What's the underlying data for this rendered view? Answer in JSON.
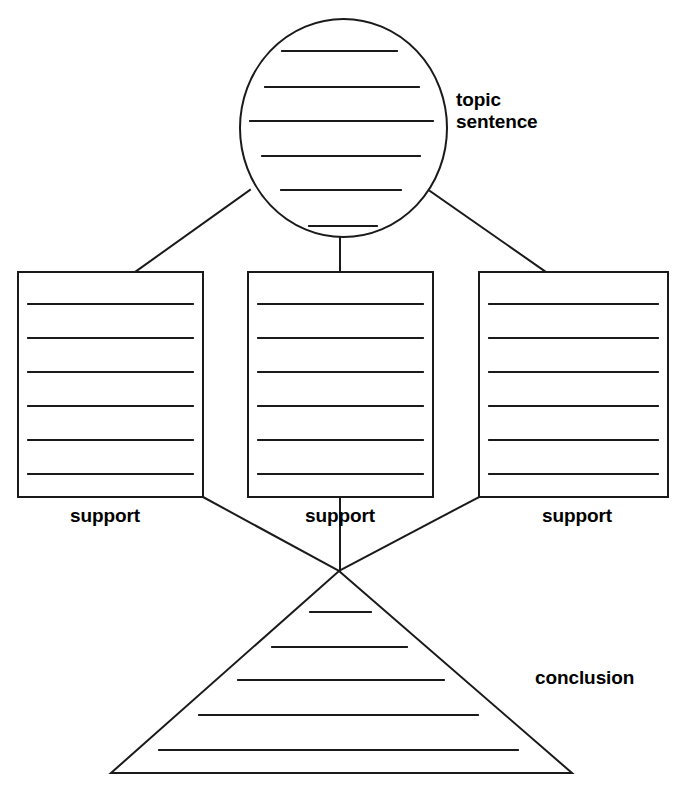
{
  "document": {
    "title": "Paragraph Writing Graphic Organizer",
    "type": "diagram",
    "background_color": "#ffffff",
    "stroke_color": "#1a1a1a",
    "text_color": "#000000"
  },
  "labels": {
    "topic_sentence": "topic\nsentence",
    "topic_sentence_line1": "topic",
    "topic_sentence_line2": "sentence",
    "support_left": "support",
    "support_middle": "support",
    "support_right": "support",
    "conclusion": "conclusion"
  },
  "shapes": {
    "topic_circle": {
      "name": "topic-sentence-circle",
      "cx": 343.5,
      "cy": 128,
      "rx": 103.5,
      "ry": 109,
      "writing_lines": 6
    },
    "support_box_left": {
      "name": "support-box-left",
      "x": 18,
      "y": 272,
      "width": 185,
      "height": 225,
      "writing_lines": 6
    },
    "support_box_middle": {
      "name": "support-box-middle",
      "x": 248,
      "y": 272,
      "width": 185,
      "height": 225,
      "writing_lines": 6
    },
    "support_box_right": {
      "name": "support-box-right",
      "x": 479,
      "y": 272,
      "width": 189,
      "height": 225,
      "writing_lines": 6
    },
    "conclusion_triangle": {
      "name": "conclusion-triangle",
      "apex_x": 339,
      "apex_y": 571,
      "base_left_x": 111,
      "base_right_x": 572,
      "base_y": 773,
      "writing_lines": 5
    }
  },
  "connectors": [
    {
      "name": "circle-to-left-box",
      "from": [
        250,
        190
      ],
      "to": [
        135,
        272
      ]
    },
    {
      "name": "circle-to-middle-box",
      "from": [
        340,
        236
      ],
      "to": [
        340,
        272
      ]
    },
    {
      "name": "circle-to-right-box",
      "from": [
        430,
        191
      ],
      "to": [
        546,
        272
      ]
    },
    {
      "name": "left-box-to-triangle",
      "from": [
        203,
        497
      ],
      "to": [
        339,
        571
      ]
    },
    {
      "name": "middle-box-to-triangle",
      "from": [
        340,
        497
      ],
      "to": [
        340,
        571
      ]
    },
    {
      "name": "right-box-to-triangle",
      "from": [
        479,
        497
      ],
      "to": [
        339,
        571
      ]
    }
  ],
  "circle_lines": [
    {
      "x1": 282,
      "x2": 397,
      "y": 51
    },
    {
      "x1": 265,
      "x2": 419,
      "y": 87
    },
    {
      "x1": 250,
      "x2": 433,
      "y": 121
    },
    {
      "x1": 262,
      "x2": 420,
      "y": 156
    },
    {
      "x1": 281,
      "x2": 401,
      "y": 190
    },
    {
      "x1": 309,
      "x2": 377,
      "y": 226
    }
  ],
  "box_line_offsets": [
    32,
    66,
    100,
    134,
    168,
    202
  ],
  "triangle_lines": [
    {
      "x1": 310,
      "x2": 371,
      "y": 612
    },
    {
      "x1": 272,
      "x2": 407,
      "y": 647
    },
    {
      "x1": 238,
      "x2": 444,
      "y": 680
    },
    {
      "x1": 199,
      "x2": 478,
      "y": 715
    },
    {
      "x1": 159,
      "x2": 518,
      "y": 750
    }
  ]
}
